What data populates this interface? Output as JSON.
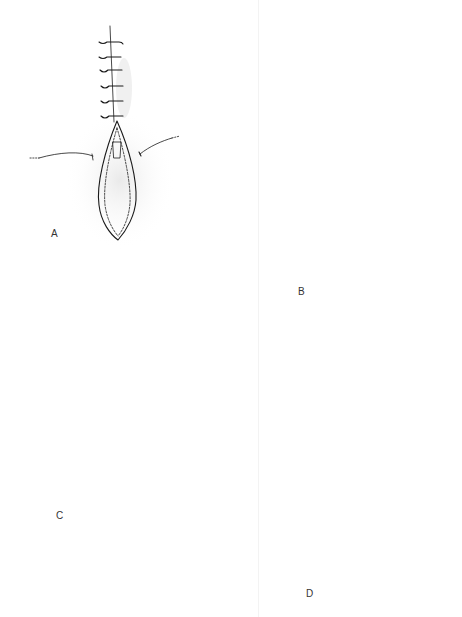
{
  "figure": {
    "ink_color": "#1a1a1a",
    "background_color": "#ffffff",
    "panels": [
      {
        "id": "A",
        "label": "A",
        "content": "Elliptical open wound with a column of six interrupted sutures above; two retracting skin lines on either side"
      },
      {
        "id": "B",
        "label": "B",
        "content": "Elliptical open wound with a central vertical closure line and three pairs of untied suture loops; two pull lines at right and a hook at left"
      },
      {
        "id": "C",
        "label": "C",
        "content": "Partially closed wound with Y-shaped top, four interrupted sutures, a looped suture at left and horizontal traction lines with a crossbar"
      },
      {
        "id": "D",
        "label": "D",
        "content": "Partially closed wound with V-shaped flaps, curved suture loops along both sides, crossbars and a narrow elliptical remaining opening"
      }
    ]
  }
}
